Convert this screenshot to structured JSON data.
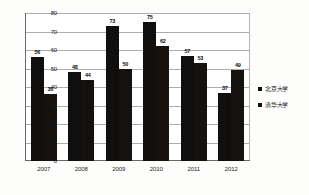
{
  "chart_data": {
    "type": "bar",
    "title": "",
    "xlabel": "",
    "ylabel": "",
    "categories": [
      "2007",
      "2008",
      "2009",
      "2010",
      "2011",
      "2012"
    ],
    "series": [
      {
        "name": "北京大学",
        "values": [
          56,
          48,
          73,
          75,
          57,
          37
        ],
        "color": "#100f0d"
      },
      {
        "name": "清华大学",
        "values": [
          36,
          44,
          50,
          62,
          53,
          49
        ],
        "color": "#15110f"
      }
    ],
    "ylim": [
      0,
      80
    ],
    "yticks": [
      0,
      10,
      20,
      30,
      40,
      50,
      60,
      70,
      80
    ],
    "grid": true,
    "legend_position": "right",
    "data_labels": true
  },
  "legend": {
    "items": [
      {
        "label": "北京大学"
      },
      {
        "label": "清华大学"
      }
    ]
  }
}
